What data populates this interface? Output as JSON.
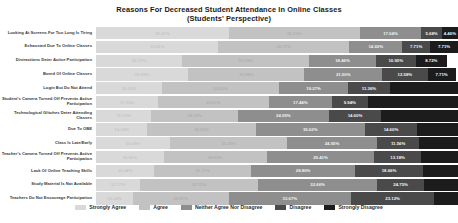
{
  "chart_data": {
    "type": "bar",
    "orientation": "horizontal",
    "stacked": true,
    "stack_unit": "percent",
    "title": "Reasons For Decreased Student Attendance In Online Classes",
    "subtitle": "(Students' Perspective)",
    "xlabel": "",
    "ylabel": "",
    "xlim": [
      0,
      100
    ],
    "grid": false,
    "legend_position": "bottom",
    "legend": [
      "Strongly Agree",
      "Agree",
      "Neither Agree Nor Disagree",
      "Disagree",
      "Strongly Disagree"
    ],
    "colors": [
      "#d9d9d9",
      "#c2c2c2",
      "#8e8e8e",
      "#4a4a4a",
      "#1c1c1c"
    ],
    "categories": [
      "Looking At Screens For Too Long Is Tiring",
      "Exhausted Due To Online Classes",
      "Distractions Deter Active Participation",
      "Bored Of Online Classes",
      "Login But Do Not Attend",
      "Student's Camera Turned Off Prevents Active Participation",
      "Technological Glitches Deter Attending Classes",
      "Due To OBE",
      "Class Is Late/Early",
      "Teacher's Camera Turned Off Prevents Active Participation",
      "Lack Of Online Teaching Skills",
      "Study Material Is Not Available",
      "Teachers Do Not Encourage Participation"
    ],
    "series": [
      {
        "name": "Strongly Agree",
        "values": [
          36.61,
          33.81,
          23.77,
          25.49,
          18.22,
          17.11,
          15.15,
          14.14,
          20.49,
          18.66,
          16.04,
          12.17,
          10.14
        ]
      },
      {
        "name": "Agree",
        "values": [
          36.21,
          36.17,
          35.1,
          32.04,
          32.25,
          30.61,
          24.14,
          30.02,
          32.23,
          28.65,
          26.77,
          32.72,
          26.57
        ]
      },
      {
        "name": "Neither Agree Nor Disagree",
        "values": [
          17.04,
          14.6,
          18.46,
          21.5,
          19.27,
          17.44,
          24.95,
          30.02,
          24.95,
          29.41,
          28.8,
          32.66,
          33.67
        ]
      },
      {
        "name": "Disagree",
        "values": [
          5.68,
          7.71,
          10.95,
          12.58,
          11.36,
          9.94,
          14.6,
          14.6,
          11.56,
          13.18,
          18.66,
          13.18,
          23.12
        ]
      },
      {
        "name": "Strongly Disagree",
        "values": [
          4.46,
          7.71,
          8.72,
          7.71,
          18.9,
          24.9,
          21.16,
          11.22,
          10.77,
          10.1,
          9.73,
          9.27,
          6.5
        ]
      }
    ],
    "value_labels": [
      [
        "36.61%",
        "36.21%",
        "17.04%",
        "5.68%",
        "4.46%"
      ],
      [
        "33.81%",
        "36.17%",
        "14.60%",
        "7.71%",
        "7.71%"
      ],
      [
        "23.77%",
        "35.10%",
        "18.46%",
        "10.95%",
        "8.72%"
      ],
      [
        "25.49%",
        "32.04%",
        "21.50%",
        "12.58%",
        "7.71%"
      ],
      [
        "18.22%",
        "32.25%",
        "19.27%",
        "11.36%",
        ""
      ],
      [
        "17.11%",
        "30.61%",
        "17.44%",
        "9.94%",
        ""
      ],
      [
        "15.15%",
        "24.14%",
        "24.95%",
        "14.60%",
        ""
      ],
      [
        "14.14%",
        "30.02%",
        "30.02%",
        "14.60%",
        ""
      ],
      [
        "20.49%",
        "32.23%",
        "24.95%",
        "11.56%",
        ""
      ],
      [
        "18.66%",
        "28.65%",
        "29.41%",
        "13.18%",
        ""
      ],
      [
        "16.04%",
        "26.77%",
        "28.80%",
        "18.66%",
        ""
      ],
      [
        "12.17%",
        "32.72%",
        "32.66%",
        "24.75%",
        ""
      ],
      [
        "10.14%",
        "26.57%",
        "33.67%",
        "23.12%",
        ""
      ]
    ]
  }
}
